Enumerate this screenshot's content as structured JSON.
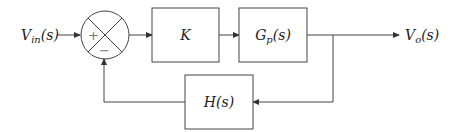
{
  "diagram": {
    "type": "block-diagram-feedback-loop",
    "input": {
      "label": "V",
      "sub": "in",
      "arg": "(s)"
    },
    "output": {
      "label": "V",
      "sub": "o",
      "arg": "(s)"
    },
    "summing_junction": {
      "plus_sign": "+",
      "minus_sign": "−"
    },
    "blocks": [
      {
        "id": "K",
        "label": "K"
      },
      {
        "id": "Gp",
        "label": "G",
        "sub": "p",
        "arg": "(s)"
      },
      {
        "id": "H",
        "label": "H",
        "arg": "(s)"
      }
    ],
    "connections": [
      "Vin(s) -> summing junction (+)",
      "summing junction -> K",
      "K -> Gp(s)",
      "Gp(s) -> Vo(s)",
      "Vo(s) -> H(s) (feedback)",
      "H(s) -> summing junction (-)"
    ]
  }
}
